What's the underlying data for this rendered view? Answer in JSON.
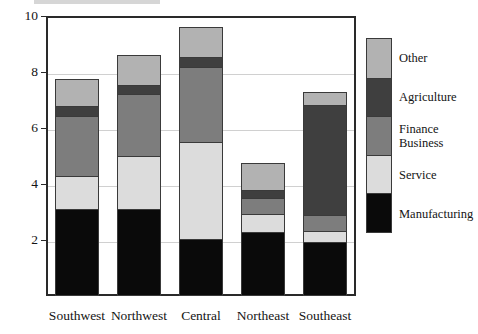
{
  "chart_data": {
    "type": "bar",
    "subtype": "stacked-vertical",
    "title": "",
    "xlabel": "",
    "ylabel": "",
    "ylim": [
      0,
      10
    ],
    "yticks": [
      2,
      4,
      6,
      8,
      10
    ],
    "ytick_labels": [
      "2",
      "4",
      "6",
      "8",
      "10"
    ],
    "grid": true,
    "legend_position": "right",
    "categories": [
      "Southwest",
      "Northwest",
      "Central",
      "Northeast",
      "Southeast"
    ],
    "series": [
      {
        "name": "Manufacturing",
        "color": "#0a0a0a",
        "values": [
          3.1,
          3.1,
          2.0,
          2.3,
          1.9
        ]
      },
      {
        "name": "Service",
        "color": "#dcdcdc",
        "values": [
          1.2,
          1.9,
          3.5,
          0.65,
          0.4
        ]
      },
      {
        "name": "Finance\nBusiness",
        "color": "#7d7d7d",
        "values": [
          2.15,
          2.25,
          2.7,
          0.55,
          0.6
        ]
      },
      {
        "name": "Agriculture",
        "color": "#3f3f3f",
        "values": [
          0.35,
          0.3,
          0.35,
          0.3,
          3.95
        ]
      },
      {
        "name": "Other",
        "color": "#b2b2b2",
        "values": [
          0.95,
          1.05,
          1.05,
          0.95,
          0.45
        ]
      }
    ],
    "totals": [
      7.75,
      8.6,
      9.6,
      4.75,
      7.3
    ]
  },
  "legend": {
    "entries": [
      {
        "label": "Other",
        "color": "#b2b2b2"
      },
      {
        "label": "Agriculture",
        "color": "#3f3f3f"
      },
      {
        "label": "Finance\nBusiness",
        "color": "#7d7d7d"
      },
      {
        "label": "Service",
        "color": "#dcdcdc"
      },
      {
        "label": "Manufacturing",
        "color": "#0a0a0a"
      }
    ]
  },
  "axis": {
    "y_labels": [
      "10",
      "8",
      "6",
      "4",
      "2"
    ],
    "x_labels": [
      "Southwest",
      "Northwest",
      "Central",
      "Northeast",
      "Southeast"
    ]
  },
  "colors": {
    "frame": "#2a2a2a",
    "grid": "#d0d0d0",
    "background": "#ffffff",
    "text": "#141414"
  }
}
